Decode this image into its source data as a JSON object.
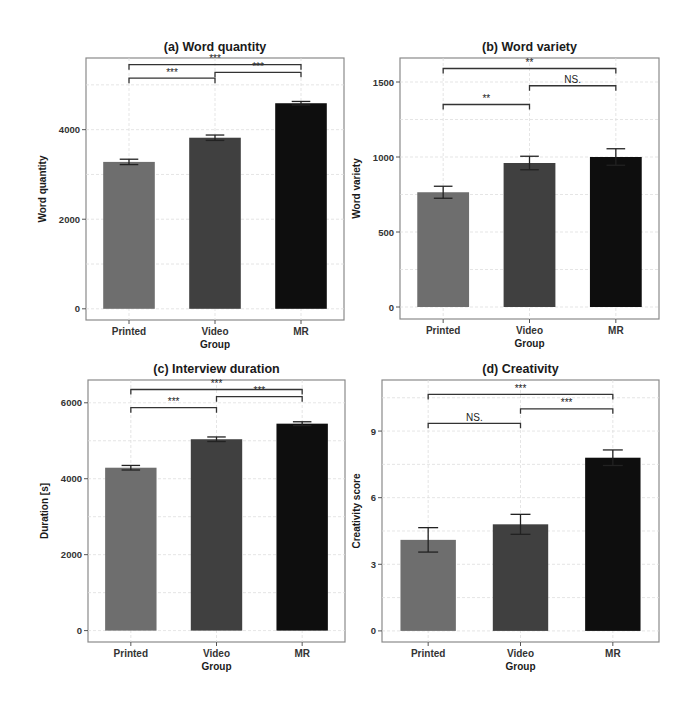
{
  "figure": {
    "x_axis_label": "Group",
    "groups": [
      "Printed",
      "Video",
      "MR"
    ],
    "bar_colors": {
      "Printed": "#6e6e6e",
      "Video": "#404040",
      "MR": "#0e0e0e"
    }
  },
  "chart_data": [
    {
      "type": "bar",
      "title": "(a) Word quantity",
      "xlabel": "Group",
      "ylabel": "Word quantity",
      "categories": [
        "Printed",
        "Video",
        "MR"
      ],
      "values": [
        3280,
        3820,
        4590
      ],
      "errors": [
        60,
        60,
        40
      ],
      "yticks": [
        0,
        2000,
        4000
      ],
      "ylim": [
        -250,
        5600
      ],
      "grid": true,
      "significance": [
        {
          "from": "Printed",
          "to": "Video",
          "label": "***",
          "y": 5150
        },
        {
          "from": "Video",
          "to": "MR",
          "label": "***",
          "y": 5280
        },
        {
          "from": "Printed",
          "to": "MR",
          "label": "***",
          "y": 5450
        }
      ]
    },
    {
      "type": "bar",
      "title": "(b) Word variety",
      "xlabel": "Group",
      "ylabel": "Word variety",
      "categories": [
        "Printed",
        "Video",
        "MR"
      ],
      "values": [
        765,
        960,
        1000
      ],
      "errors": [
        40,
        45,
        55
      ],
      "yticks": [
        0,
        500,
        1000,
        1500
      ],
      "ylim": [
        -80,
        1660
      ],
      "grid": true,
      "significance": [
        {
          "from": "Printed",
          "to": "Video",
          "label": "**",
          "y": 1350
        },
        {
          "from": "Video",
          "to": "MR",
          "label": "NS.",
          "y": 1475
        },
        {
          "from": "Printed",
          "to": "MR",
          "label": "**",
          "y": 1590
        }
      ]
    },
    {
      "type": "bar",
      "title": "(c) Interview duration",
      "xlabel": "Group",
      "ylabel": "Duration [s]",
      "categories": [
        "Printed",
        "Video",
        "MR"
      ],
      "values": [
        4290,
        5040,
        5450
      ],
      "errors": [
        60,
        60,
        50
      ],
      "yticks": [
        0,
        2000,
        4000,
        6000
      ],
      "ylim": [
        -300,
        6600
      ],
      "grid": true,
      "significance": [
        {
          "from": "Printed",
          "to": "Video",
          "label": "***",
          "y": 5870
        },
        {
          "from": "Video",
          "to": "MR",
          "label": "***",
          "y": 6160
        },
        {
          "from": "Printed",
          "to": "MR",
          "label": "***",
          "y": 6350
        }
      ]
    },
    {
      "type": "bar",
      "title": "(d) Creativity",
      "xlabel": "Group",
      "ylabel": "Creativity score",
      "categories": [
        "Printed",
        "Video",
        "MR"
      ],
      "values": [
        4.1,
        4.8,
        7.8
      ],
      "errors": [
        0.55,
        0.45,
        0.35
      ],
      "yticks": [
        0,
        3,
        6,
        9
      ],
      "ylim": [
        -0.5,
        11.3
      ],
      "grid": true,
      "significance": [
        {
          "from": "Printed",
          "to": "Video",
          "label": "NS.",
          "y": 9.35
        },
        {
          "from": "Video",
          "to": "MR",
          "label": "***",
          "y": 10.0
        },
        {
          "from": "Printed",
          "to": "MR",
          "label": "***",
          "y": 10.65
        }
      ]
    }
  ],
  "panels_layout": [
    {
      "left": 86,
      "top": 58,
      "right": 344,
      "bottom": 320
    },
    {
      "left": 400,
      "top": 58,
      "right": 659,
      "bottom": 319
    },
    {
      "left": 88,
      "top": 380,
      "right": 345,
      "bottom": 642
    },
    {
      "left": 382,
      "top": 380,
      "right": 659,
      "bottom": 642
    }
  ]
}
